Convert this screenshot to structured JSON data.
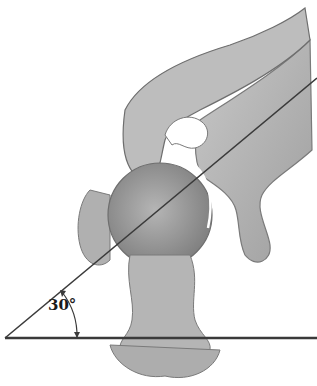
{
  "figure": {
    "type": "anatomical-illustration",
    "angle_label": "30°",
    "colors": {
      "bone": "#b9b9b9",
      "bone_dark": "#8a8a8a",
      "line": "#3a3a3a",
      "background": "#ffffff"
    }
  }
}
